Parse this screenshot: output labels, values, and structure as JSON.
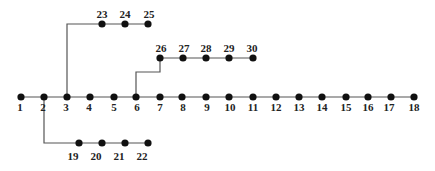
{
  "diagram": {
    "type": "radial-distribution-network",
    "node_color": "#111111",
    "line_color": "#555555",
    "nodes": [
      {
        "id": "1",
        "x": 21,
        "y": 97,
        "lx": 20,
        "ly": 111
      },
      {
        "id": "2",
        "x": 44,
        "y": 97,
        "lx": 43,
        "ly": 111
      },
      {
        "id": "3",
        "x": 67,
        "y": 97,
        "lx": 66,
        "ly": 111
      },
      {
        "id": "4",
        "x": 90,
        "y": 97,
        "lx": 89,
        "ly": 111
      },
      {
        "id": "5",
        "x": 114,
        "y": 97,
        "lx": 114,
        "ly": 111
      },
      {
        "id": "6",
        "x": 136,
        "y": 97,
        "lx": 137,
        "ly": 111
      },
      {
        "id": "7",
        "x": 160,
        "y": 97,
        "lx": 160,
        "ly": 111
      },
      {
        "id": "8",
        "x": 182,
        "y": 97,
        "lx": 183,
        "ly": 111
      },
      {
        "id": "9",
        "x": 206,
        "y": 97,
        "lx": 207,
        "ly": 111
      },
      {
        "id": "10",
        "x": 229,
        "y": 97,
        "lx": 230,
        "ly": 111
      },
      {
        "id": "11",
        "x": 253,
        "y": 97,
        "lx": 253,
        "ly": 111
      },
      {
        "id": "12",
        "x": 276,
        "y": 97,
        "lx": 276,
        "ly": 111
      },
      {
        "id": "13",
        "x": 299,
        "y": 97,
        "lx": 299,
        "ly": 111
      },
      {
        "id": "14",
        "x": 322,
        "y": 97,
        "lx": 322,
        "ly": 111
      },
      {
        "id": "15",
        "x": 346,
        "y": 97,
        "lx": 346,
        "ly": 111
      },
      {
        "id": "16",
        "x": 368,
        "y": 97,
        "lx": 368,
        "ly": 111
      },
      {
        "id": "17",
        "x": 391,
        "y": 97,
        "lx": 389,
        "ly": 111
      },
      {
        "id": "18",
        "x": 414,
        "y": 97,
        "lx": 414,
        "ly": 111
      },
      {
        "id": "19",
        "x": 79,
        "y": 143,
        "lx": 73,
        "ly": 160
      },
      {
        "id": "20",
        "x": 102,
        "y": 143,
        "lx": 96,
        "ly": 160
      },
      {
        "id": "21",
        "x": 125,
        "y": 143,
        "lx": 119,
        "ly": 160
      },
      {
        "id": "22",
        "x": 148,
        "y": 143,
        "lx": 142,
        "ly": 160
      },
      {
        "id": "23",
        "x": 102,
        "y": 24,
        "lx": 102,
        "ly": 18
      },
      {
        "id": "24",
        "x": 125,
        "y": 24,
        "lx": 125,
        "ly": 18
      },
      {
        "id": "25",
        "x": 148,
        "y": 24,
        "lx": 149,
        "ly": 18
      },
      {
        "id": "26",
        "x": 160,
        "y": 58,
        "lx": 161,
        "ly": 52
      },
      {
        "id": "27",
        "x": 183,
        "y": 58,
        "lx": 184,
        "ly": 52
      },
      {
        "id": "28",
        "x": 206,
        "y": 58,
        "lx": 206,
        "ly": 52
      },
      {
        "id": "29",
        "x": 229,
        "y": 58,
        "lx": 229,
        "ly": 52
      },
      {
        "id": "30",
        "x": 253,
        "y": 58,
        "lx": 252,
        "ly": 52
      }
    ],
    "lines": [
      {
        "name": "main-feeder",
        "points": "21,97 414,97"
      },
      {
        "name": "lateral-2-19",
        "points": "44,97 44,143 148,143"
      },
      {
        "name": "lateral-3-23",
        "points": "67,97 67,24 148,24"
      },
      {
        "name": "lateral-6-26",
        "points": "136,97 136,72 160,72 160,58 253,58"
      }
    ]
  }
}
